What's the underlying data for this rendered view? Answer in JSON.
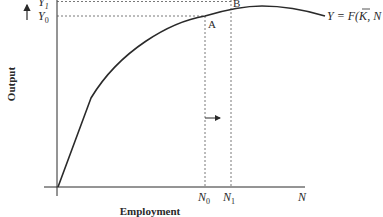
{
  "diagram": {
    "axes": {
      "y_label": "Output",
      "x_label": "Employment",
      "x_end_label": "N"
    },
    "curve_label": "Y = F(K̄, N)",
    "curve_label_parts": {
      "prefix": "Y = F(",
      "kbar": "K",
      "suffix": ", N"
    },
    "points": [
      {
        "name": "A",
        "x_label": "N",
        "x_sub": "0",
        "y_label": "Y",
        "y_sub": "0"
      },
      {
        "name": "B",
        "x_label": "N",
        "x_sub": "1",
        "y_label": "Y",
        "y_sub": "1"
      }
    ],
    "annotations": {
      "up_arrow": "output-increase",
      "right_arrow": "employment-increase"
    },
    "colors": {
      "line": "#2a2a2a",
      "dashed": "#555555",
      "background": "#ffffff"
    }
  }
}
